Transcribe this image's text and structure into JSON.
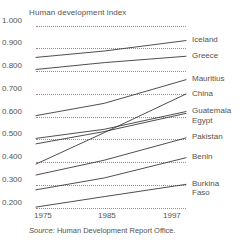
{
  "chart_data": {
    "type": "line",
    "title": "Human development index",
    "xlabel": "",
    "ylabel": "",
    "x": [
      1975,
      1985,
      1997
    ],
    "xtick_labels": [
      "1975",
      "1985",
      "1997"
    ],
    "ytick_labels": [
      "1.000",
      "0.900",
      "0.800",
      "0.700",
      "0.600",
      "0.500",
      "0.400",
      "0.300",
      "0.200"
    ],
    "ylim": [
      0.2,
      1.0
    ],
    "xlim": [
      1975,
      1997
    ],
    "grid": "horizontal-dotted",
    "legend_position": "right-of-line-ends",
    "line_color": "#3d3a38",
    "grid_color": "#b0705c",
    "series": [
      {
        "name": "Iceland",
        "values": [
          0.862,
          0.89,
          0.936
        ]
      },
      {
        "name": "Greece",
        "values": [
          0.809,
          0.839,
          0.867
        ]
      },
      {
        "name": "Mauritius",
        "values": [
          0.606,
          0.66,
          0.764
        ]
      },
      {
        "name": "China",
        "values": [
          0.393,
          0.531,
          0.701
        ]
      },
      {
        "name": "Guatemala",
        "values": [
          0.506,
          0.546,
          0.624
        ]
      },
      {
        "name": "Egypt",
        "values": [
          0.482,
          0.536,
          0.616
        ]
      },
      {
        "name": "Pakistan",
        "values": [
          0.345,
          0.41,
          0.508
        ]
      },
      {
        "name": "Benin",
        "values": [
          0.28,
          0.332,
          0.421
        ]
      },
      {
        "name": "Burkina Faso",
        "values": [
          0.204,
          0.25,
          0.304
        ]
      }
    ]
  },
  "legend": {
    "items": [
      {
        "label": "Iceland",
        "label2": ""
      },
      {
        "label": "Greece",
        "label2": ""
      },
      {
        "label": "Mauritius",
        "label2": ""
      },
      {
        "label": "China",
        "label2": ""
      },
      {
        "label": "Guatemala",
        "label2": ""
      },
      {
        "label": "Egypt",
        "label2": ""
      },
      {
        "label": "Pakistan",
        "label2": ""
      },
      {
        "label": "Benin",
        "label2": ""
      },
      {
        "label": "Burkina",
        "label2": "Faso"
      }
    ]
  },
  "footer": {
    "source_word": "Source:",
    "source_text": " Human Development Report Office."
  }
}
